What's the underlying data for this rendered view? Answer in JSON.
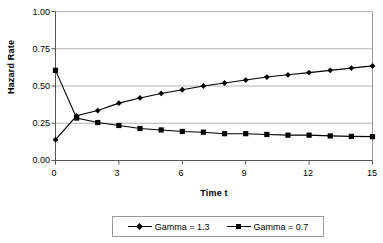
{
  "chart_data": {
    "type": "line",
    "title": "",
    "xlabel": "Time t",
    "ylabel": "Hazard Rate",
    "xlim": [
      0,
      15
    ],
    "ylim": [
      0,
      1.0
    ],
    "grid": true,
    "legend_position": "bottom",
    "x": [
      0,
      1,
      2,
      3,
      4,
      5,
      6,
      7,
      8,
      9,
      10,
      11,
      12,
      13,
      14,
      15
    ],
    "xticks": [
      "0",
      "3",
      "6",
      "9",
      "12",
      "15"
    ],
    "xtick_values": [
      0,
      3,
      6,
      9,
      12,
      15
    ],
    "yticks": [
      "0.00",
      "0.25",
      "0.50",
      "0.75",
      "1.00"
    ],
    "ytick_values": [
      0.0,
      0.25,
      0.5,
      0.75,
      1.0
    ],
    "series": [
      {
        "name": "Gamma = 1.3",
        "marker": "diamond",
        "color": "#000000",
        "values": [
          0.14,
          0.3,
          0.335,
          0.385,
          0.42,
          0.45,
          0.475,
          0.5,
          0.52,
          0.54,
          0.56,
          0.575,
          0.59,
          0.605,
          0.62,
          0.635
        ]
      },
      {
        "name": "Gamma = 0.7",
        "marker": "square",
        "color": "#000000",
        "values": [
          0.605,
          0.285,
          0.255,
          0.235,
          0.215,
          0.205,
          0.195,
          0.19,
          0.18,
          0.18,
          0.175,
          0.17,
          0.17,
          0.165,
          0.162,
          0.16
        ]
      }
    ]
  },
  "legend": {
    "entries": [
      {
        "label": "Gamma = 1.3"
      },
      {
        "label": "Gamma = 0.7"
      }
    ]
  }
}
